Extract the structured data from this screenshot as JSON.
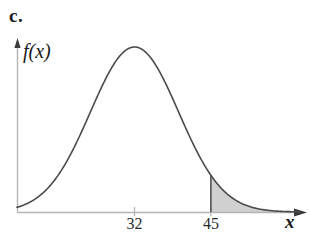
{
  "figure": {
    "part_label": "c.",
    "y_axis_label": "f(x)",
    "x_axis_label": "x"
  },
  "chart_data": {
    "type": "line",
    "title": "",
    "subtitle": "",
    "xlabel": "x",
    "ylabel": "f(x)",
    "distribution": "normal",
    "mean": 32,
    "std_dev": 7.5,
    "grid": false,
    "legend": null,
    "axis_arrows": {
      "x": true,
      "y": true
    },
    "xlim": [
      12,
      60
    ],
    "ylim": [
      0,
      1.08
    ],
    "tick_labels_x": [
      "32",
      "45"
    ],
    "ticks_x": [
      32,
      45
    ],
    "ticks_y": [],
    "shaded_region": {
      "label": "",
      "from": 45,
      "to": 60,
      "color": "#d0d0d0",
      "boundary_line_at": 45
    },
    "curve_color": "#4a4a4a",
    "axis_color": "#b4b4b4",
    "x": [
      12,
      14,
      16,
      18,
      20,
      22,
      24,
      26,
      28,
      30,
      32,
      34,
      36,
      38,
      40,
      42,
      44,
      45,
      46,
      48,
      50,
      52,
      54,
      56,
      58,
      60
    ],
    "y": [
      0.008,
      0.018,
      0.036,
      0.068,
      0.118,
      0.191,
      0.287,
      0.402,
      0.522,
      0.634,
      0.717,
      0.761,
      0.761,
      0.717,
      0.634,
      0.522,
      0.402,
      0.345,
      0.287,
      0.191,
      0.118,
      0.068,
      0.036,
      0.018,
      0.008,
      0.003
    ]
  },
  "colors": {
    "curve": "#4a4a4a",
    "axis": "#b4b4b4",
    "shade": "#d0d0d0",
    "text": "#1a1a1a",
    "background": "#ffffff"
  }
}
